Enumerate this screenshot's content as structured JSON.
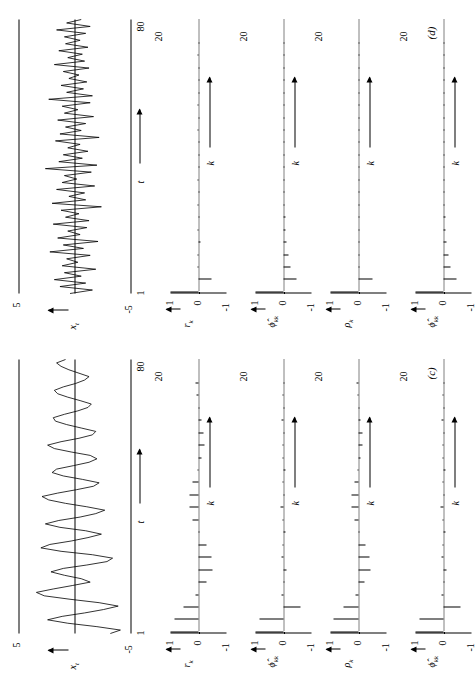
{
  "figure": {
    "panels": [
      {
        "tag": "(c)",
        "timeseries": {
          "ylabel": "x",
          "ylabel_sub": "t",
          "xlabel": "t",
          "ytop": "5",
          "ybottom": "-5",
          "xstart": "1",
          "xend": "80",
          "values": [
            -3.2,
            -4.1,
            -2.0,
            0.6,
            2.4,
            1.1,
            -0.9,
            -2.6,
            -3.9,
            -2.2,
            0.4,
            2.7,
            3.4,
            1.9,
            0.2,
            -1.4,
            -0.6,
            0.9,
            2.1,
            1.0,
            -1.1,
            -2.9,
            -3.4,
            -1.6,
            1.2,
            3.0,
            2.2,
            0.3,
            -1.2,
            -2.4,
            -1.0,
            1.3,
            2.6,
            1.4,
            -0.5,
            -1.9,
            -2.7,
            -1.1,
            0.8,
            2.3,
            2.9,
            1.5,
            -0.2,
            -1.7,
            -2.2,
            -0.7,
            1.0,
            2.0,
            1.6,
            0.1,
            -1.3,
            -2.0,
            -1.4,
            0.3,
            1.8,
            2.4,
            1.2,
            -0.4,
            -1.6,
            -1.9,
            -0.6,
            0.7,
            1.7,
            1.9,
            0.9,
            -0.3,
            -1.2,
            -1.5,
            -0.5,
            0.6,
            1.5,
            1.8,
            1.0,
            -0.1,
            -0.9,
            -1.3,
            -0.4,
            0.5,
            1.2,
            1.6,
            0.8
          ]
        },
        "acf": {
          "ylabel": "r",
          "ylabel_sub": "k",
          "xlabel": "k",
          "ytop": "1",
          "ybottom": "-1",
          "xend": "20",
          "values": [
            1.0,
            0.86,
            0.52,
            0.1,
            -0.28,
            -0.5,
            -0.48,
            -0.3,
            -0.04,
            0.2,
            0.33,
            0.32,
            0.2,
            0.03,
            -0.12,
            -0.2,
            -0.19,
            -0.11,
            0.0,
            0.08,
            0.12
          ]
        },
        "pacf": {
          "ylabel": "ϕ",
          "ylabel_sub": "kk",
          "xlabel": "k",
          "ytop": "1",
          "ybottom": "-1",
          "xend": "20",
          "values": [
            1.0,
            0.86,
            -0.62,
            0.06,
            -0.04,
            -0.1,
            0.08,
            0.04,
            -0.06,
            0.02,
            0.1,
            -0.04,
            0.02,
            -0.08,
            0.04,
            0.02,
            -0.02,
            0.06,
            -0.04,
            0.02,
            0.0
          ]
        },
        "theoretical": {
          "ylabel": "ρ",
          "ylabel_sub": "k",
          "xlabel": "k",
          "ytop": "1",
          "ybottom": "-1",
          "xend": "20",
          "values": [
            1.0,
            0.88,
            0.55,
            0.12,
            -0.22,
            -0.42,
            -0.4,
            -0.24,
            -0.02,
            0.16,
            0.26,
            0.24,
            0.14,
            0.02,
            -0.08,
            -0.14,
            -0.13,
            -0.07,
            0.0,
            0.05,
            0.08
          ]
        }
      },
      {
        "tag": "(d)",
        "timeseries": {
          "ylabel": "x",
          "ylabel_sub": "t",
          "xlabel": "t",
          "ytop": "5",
          "ybottom": "-5",
          "xstart": "1",
          "xend": "80",
          "values": [
            0.4,
            -1.6,
            1.3,
            -1.0,
            1.8,
            -0.6,
            0.9,
            -1.9,
            1.1,
            -0.3,
            0.7,
            -1.4,
            2.2,
            -0.8,
            1.0,
            -2.1,
            1.5,
            -0.5,
            0.6,
            -1.1,
            1.9,
            -1.3,
            0.8,
            -0.4,
            1.2,
            -2.4,
            2.0,
            -1.0,
            0.5,
            -0.9,
            1.6,
            -1.8,
            1.1,
            -0.2,
            0.9,
            -1.5,
            2.6,
            -2.0,
            1.4,
            -0.7,
            1.0,
            -1.2,
            0.6,
            -0.5,
            1.7,
            -2.2,
            1.3,
            -0.6,
            0.8,
            -1.0,
            1.5,
            -1.7,
            0.9,
            -0.3,
            1.1,
            -1.4,
            2.3,
            -1.6,
            0.7,
            -0.8,
            1.2,
            -1.1,
            0.5,
            -0.4,
            1.0,
            -1.3,
            1.8,
            -0.9,
            0.6,
            -0.7,
            1.4,
            -1.2,
            0.8,
            -0.5,
            0.9,
            -1.0,
            1.6,
            -1.4,
            0.7,
            -0.6
          ]
        },
        "acf": {
          "ylabel": "r",
          "ylabel_sub": "k",
          "xlabel": "k",
          "ytop": "1",
          "ybottom": "-1",
          "xend": "20",
          "values": [
            1.0,
            -0.48,
            0.04,
            0.02,
            -0.06,
            0.05,
            -0.03,
            0.02,
            -0.04,
            0.03,
            -0.02,
            0.01,
            -0.03,
            0.02,
            -0.01,
            0.02,
            -0.02,
            0.01,
            -0.01,
            0.02,
            -0.01
          ]
        },
        "pacf": {
          "ylabel": "ϕ",
          "ylabel_sub": "kk",
          "xlabel": "k",
          "ytop": "1",
          "ybottom": "-1",
          "xend": "20",
          "values": [
            1.0,
            -0.48,
            -0.26,
            -0.18,
            -0.12,
            -0.08,
            -0.06,
            -0.04,
            -0.03,
            -0.02,
            -0.02,
            -0.01,
            -0.01,
            -0.01,
            0.0,
            0.0,
            0.0,
            0.0,
            0.0,
            0.0,
            0.0
          ]
        },
        "theoretical": {
          "ylabel": "ρ",
          "ylabel_sub": "k",
          "xlabel": "k",
          "ytop": "1",
          "ybottom": "-1",
          "xend": "20",
          "values": [
            1.0,
            -0.5,
            0.0,
            0.0,
            0.0,
            0.0,
            0.0,
            0.0,
            0.0,
            0.0,
            0.0,
            0.0,
            0.0,
            0.0,
            0.0,
            0.0,
            0.0,
            0.0,
            0.0,
            0.0,
            0.0
          ]
        }
      }
    ]
  }
}
